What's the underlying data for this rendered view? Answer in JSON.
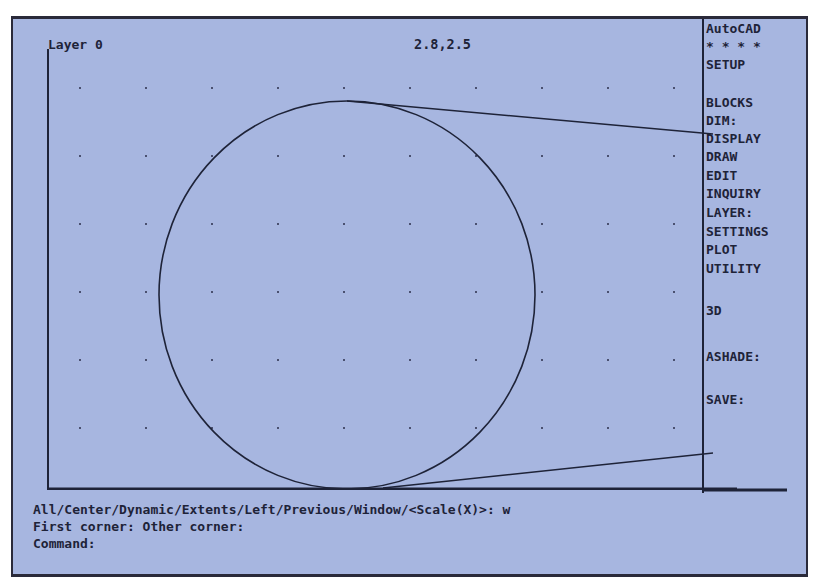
{
  "app": "AutoCAD",
  "status_bar": {
    "layer": "Layer 0",
    "coordinates": "2.8,2.5"
  },
  "side_menu": {
    "items": [
      {
        "label": "AutoCAD",
        "top": 2
      },
      {
        "label": "* * * *",
        "top": 20
      },
      {
        "label": "SETUP",
        "top": 38
      },
      {
        "label": "BLOCKS",
        "top": 76
      },
      {
        "label": "DIM:",
        "top": 94
      },
      {
        "label": "DISPLAY",
        "top": 112
      },
      {
        "label": "DRAW",
        "top": 130
      },
      {
        "label": "EDIT",
        "top": 149
      },
      {
        "label": "INQUIRY",
        "top": 167
      },
      {
        "label": "LAYER:",
        "top": 186
      },
      {
        "label": "SETTINGS",
        "top": 205
      },
      {
        "label": "PLOT",
        "top": 223
      },
      {
        "label": "UTILITY",
        "top": 242
      },
      {
        "label": "3D",
        "top": 284
      },
      {
        "label": "ASHADE:",
        "top": 330
      },
      {
        "label": "SAVE:",
        "top": 373
      }
    ]
  },
  "command_area": {
    "lines": [
      "All/Center/Dynamic/Extents/Left/Previous/Window/<Scale(X)>: w",
      "First corner: Other corner:",
      "Command:"
    ]
  },
  "drawing": {
    "line_color": "#1e2338",
    "grid_color": "#4a5070",
    "circle": {
      "cx": 300,
      "cy": 246,
      "rx": 188,
      "ry": 194
    },
    "tangent_lines": [
      {
        "x1": 300,
        "y1": 52,
        "x2": 666,
        "y2": 85
      },
      {
        "x1": 336,
        "y1": 439,
        "x2": 666,
        "y2": 404
      }
    ],
    "grid": {
      "x0": 33,
      "dx": 66,
      "nx": 10,
      "y0": 39,
      "dy": 68,
      "ny": 7
    }
  }
}
